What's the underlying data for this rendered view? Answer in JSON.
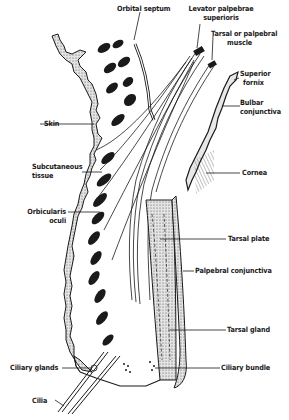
{
  "figure": {
    "type": "anatomical-cross-section",
    "colors": {
      "ink": "#1a1a1a",
      "background": "#ffffff",
      "stipple": "#bdbdbd"
    }
  },
  "labels": {
    "orbital_septum": "Orbital septum",
    "levator_line1": "Levator palpebrae",
    "levator_line2": "superioris",
    "tarsal_muscle_line1": "Tarsal or palpebral",
    "tarsal_muscle_line2": "muscle",
    "superior_fornix_line1": "Superior",
    "superior_fornix_line2": "fornix",
    "bulbar_line1": "Bulbar",
    "bulbar_line2": "conjunctiva",
    "cornea": "Cornea",
    "skin": "Skin",
    "subcutaneous_line1": "Subcutaneous",
    "subcutaneous_line2": "tissue",
    "orbicularis_line1": "Orbicularis",
    "orbicularis_line2": "oculi",
    "tarsal_plate": "Tarsal plate",
    "palpebral_conjunctiva": "Palpebral conjunctiva",
    "tarsal_gland": "Tarsal gland",
    "ciliary_glands": "Ciliary glands",
    "ciliary_bundle": "Ciliary bundle",
    "cilia": "Cilia"
  }
}
